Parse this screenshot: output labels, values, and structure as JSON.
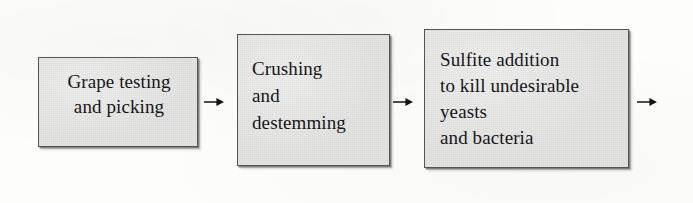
{
  "diagram": {
    "background_color": "#fdfdfc",
    "node_fill_color": "#e3e3e1",
    "node_border_color": "#55544f",
    "text_color": "#17161a",
    "arrow_color": "#141414",
    "nodes": [
      {
        "id": "grape-testing-and-picking",
        "label": "Grape testing\nand picking",
        "order": 1
      },
      {
        "id": "crushing-and-destemming",
        "label": "Crushing\nand\ndestemming",
        "order": 2
      },
      {
        "id": "sulfite-addition",
        "label": "Sulfite addition\nto kill undesirable\nyeasts\nand bacteria",
        "order": 3
      }
    ],
    "arrows": [
      {
        "id": "arrow-1",
        "from": "grape-testing-and-picking",
        "to": "crushing-and-destemming",
        "direction": "right",
        "glyph": "right-arrow-icon"
      },
      {
        "id": "arrow-2",
        "from": "crushing-and-destemming",
        "to": "sulfite-addition",
        "direction": "right",
        "glyph": "right-arrow-icon"
      },
      {
        "id": "arrow-3",
        "from": "sulfite-addition",
        "to": "",
        "direction": "right",
        "glyph": "right-arrow-icon"
      }
    ]
  }
}
